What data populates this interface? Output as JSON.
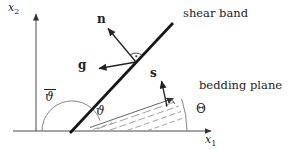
{
  "figure": {
    "type": "vector-geometry-diagram",
    "background": "#ffffff",
    "ink_color": "#222222",
    "band_color": "#1a1a1a",
    "thin_line_color": "#666666",
    "axes": {
      "x1": {
        "base": "x",
        "sub": "1"
      },
      "x2": {
        "base": "x",
        "sub": "2"
      }
    },
    "labels": {
      "shear_band": "shear band",
      "bedding_plane": "bedding plane"
    },
    "vectors": {
      "n": "n",
      "g": "g",
      "s": "s"
    },
    "angles": {
      "theta_bar": "ϑ",
      "theta": "ϑ",
      "Theta": "Θ"
    }
  }
}
